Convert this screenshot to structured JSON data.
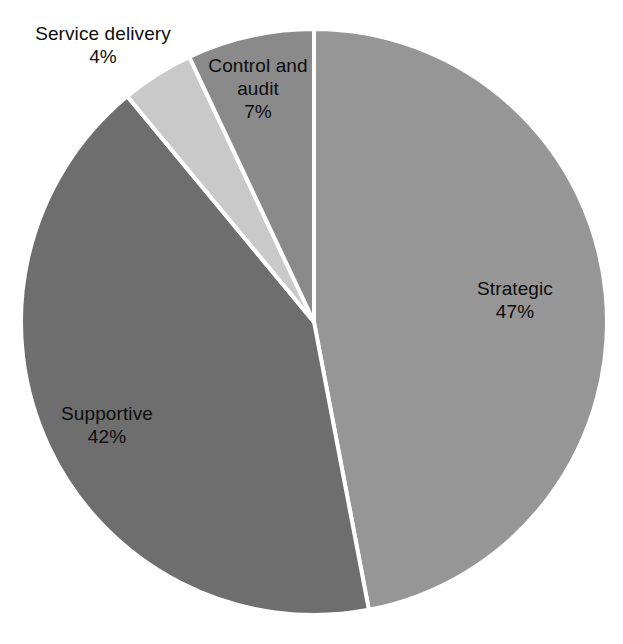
{
  "chart_data": {
    "type": "pie",
    "title": "",
    "subtitle": "",
    "xlabel": "",
    "ylabel": "",
    "legend_position": "none",
    "grid": false,
    "start_angle_deg": 0,
    "direction": "clockwise",
    "units": "percent",
    "categories": [
      "Strategic",
      "Supportive",
      "Service delivery",
      "Control and audit"
    ],
    "values": [
      47,
      42,
      4,
      7
    ],
    "slices": [
      {
        "label": "Strategic",
        "value": 47,
        "value_text": "47%",
        "color": "#969696",
        "label_placement": "inside"
      },
      {
        "label": "Supportive",
        "value": 42,
        "value_text": "42%",
        "color": "#6e6e6e",
        "label_placement": "inside"
      },
      {
        "label": "Service delivery",
        "value": 4,
        "value_text": "4%",
        "color": "#c9c9c9",
        "label_placement": "outside"
      },
      {
        "label": "Control and audit",
        "value": 7,
        "value_text": "7%",
        "color": "#8a8a8a",
        "label_placement": "inside"
      }
    ]
  },
  "figure": {
    "background": "#ffffff",
    "separator_color": "#ffffff",
    "label_text_color": "#0d0d0d",
    "center_x": 314,
    "center_y": 322,
    "radius": 293
  },
  "labels": {
    "service_delivery": {
      "name": "Service delivery",
      "value": "4%"
    },
    "control_audit": {
      "name": "Control and audit",
      "value": "7%"
    },
    "strategic": {
      "name": "Strategic",
      "value": "47%"
    },
    "supportive": {
      "name": "Supportive",
      "value": "42%"
    }
  }
}
